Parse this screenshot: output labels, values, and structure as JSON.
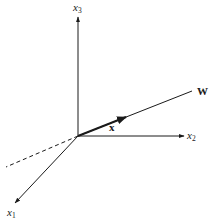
{
  "diagram": {
    "type": "3d-coordinate-axes",
    "colors": {
      "line": "#1a1a1a",
      "background": "#ffffff"
    },
    "origin": {
      "x": 78,
      "y": 136
    },
    "axes": [
      {
        "id": "x3",
        "label": "x",
        "subscript": "3",
        "direction": "up"
      },
      {
        "id": "x2",
        "label": "x",
        "subscript": "2",
        "direction": "right"
      },
      {
        "id": "x1",
        "label": "x",
        "subscript": "1",
        "direction": "down-left"
      }
    ],
    "vectors": [
      {
        "id": "W",
        "label": "W",
        "style": "line",
        "description": "Direction of weight vector W"
      },
      {
        "id": "x",
        "label": "x",
        "style": "bold-arrow",
        "description": "Vector x along W"
      }
    ],
    "dashed_extension": {
      "description": "Extension of W line behind origin",
      "style": "dashed"
    }
  }
}
